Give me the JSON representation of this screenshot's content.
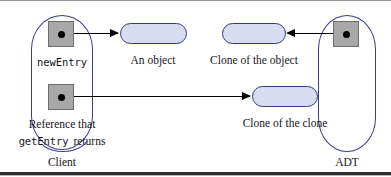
{
  "figure": {
    "type": "object-reference-diagram",
    "colors": {
      "pill_fill": "#d8dcf0",
      "pill_border": "#343a7d",
      "box_fill": "#a8a8a8",
      "box_border": "#6d6d6d",
      "container_border": "#3a3f86",
      "arrow": "#000000",
      "text": "#16161a"
    }
  },
  "containers": [
    {
      "name": "client",
      "label": "Client"
    },
    {
      "name": "adt",
      "label": "ADT"
    }
  ],
  "references": [
    {
      "name": "new-entry-reference",
      "label": "newEntry"
    },
    {
      "name": "get-entry-reference",
      "label_line1": "Reference that",
      "label_code": "getEntry",
      "label_line2": "returns"
    },
    {
      "name": "adt-internal-reference",
      "label": ""
    }
  ],
  "objects": [
    {
      "name": "an-object",
      "label": "An object"
    },
    {
      "name": "clone-of-the-object",
      "label": "Clone of the object"
    },
    {
      "name": "clone-of-the-clone",
      "label": "Clone of the clone"
    }
  ],
  "arrows": [
    {
      "name": "new-entry-to-an-object",
      "direction": "right"
    },
    {
      "name": "adt-reference-to-clone-of-the-object",
      "direction": "left"
    },
    {
      "name": "get-entry-to-clone-of-the-clone",
      "direction": "right"
    }
  ]
}
